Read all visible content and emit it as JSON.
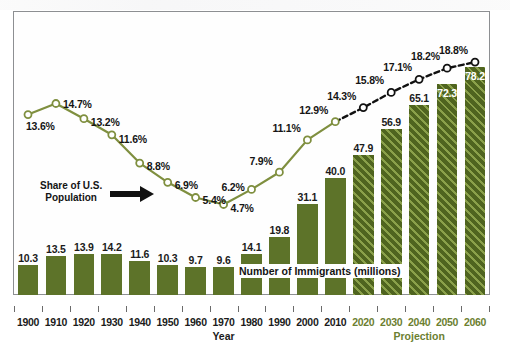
{
  "chart_data": {
    "type": "bar",
    "title": "",
    "subtitle": "",
    "xlabel": "Year",
    "ylabel": "",
    "grid": false,
    "legend_position": "none",
    "categories": [
      "1900",
      "1910",
      "1920",
      "1930",
      "1940",
      "1950",
      "1960",
      "1970",
      "1980",
      "1990",
      "2000",
      "2010",
      "2020",
      "2030",
      "2040",
      "2050",
      "2060"
    ],
    "series": [
      {
        "name": "Number of Immigrants (millions)",
        "type": "bar",
        "values": [
          10.3,
          13.5,
          13.9,
          14.2,
          11.6,
          10.3,
          9.7,
          9.6,
          14.1,
          19.8,
          31.1,
          40.0,
          47.9,
          56.9,
          65.1,
          72.3,
          78.2
        ],
        "labels": [
          "10.3",
          "13.5",
          "13.9",
          "14.2",
          "11.6",
          "10.3",
          "9.7",
          "9.6",
          "14.1",
          "19.8",
          "31.1",
          "40.0",
          "47.9",
          "56.9",
          "65.1",
          "72.3",
          "78.2"
        ],
        "projected_from_index": 12,
        "color": "#5d7329",
        "projection_color": "#4f641f"
      },
      {
        "name": "Share of U.S. Population",
        "type": "line",
        "values": [
          13.6,
          14.7,
          13.2,
          11.6,
          8.8,
          6.9,
          5.4,
          4.7,
          6.2,
          7.9,
          11.1,
          12.9,
          14.3,
          15.8,
          17.1,
          18.2,
          18.8
        ],
        "labels": [
          "13.6%",
          "14.7%",
          "13.2%",
          "11.6%",
          "8.8%",
          "6.9%",
          "5.4%",
          "4.7%",
          "6.2%",
          "7.9%",
          "11.1%",
          "12.9%",
          "14.3%",
          "15.8%",
          "17.1%",
          "18.2%",
          "18.8%"
        ],
        "projected_from_index": 12,
        "color": "#7f8f3f",
        "projection_color": "#111111",
        "marker": "open-circle"
      }
    ],
    "annotations": [
      {
        "name": "share-annotation",
        "text_line1": "Share of U.S.",
        "text_line2": "Population"
      },
      {
        "name": "immigrants-annotation",
        "text": "Number of Immigrants (millions)"
      }
    ],
    "axis_groups": [
      {
        "name": "year-group",
        "label": "Year"
      },
      {
        "name": "projection-group",
        "label": "Projection"
      }
    ],
    "ylim_bars": [
      0,
      85
    ],
    "ylim_line": [
      0,
      20
    ]
  },
  "colors": {
    "bar_green": "#5d7329",
    "hatch_green": "#8aa04a",
    "line_green": "#7f8f3f",
    "projection_black": "#111111",
    "projection_text": "#6c8031",
    "frame_border": "#8d8f92",
    "text_dark": "#151515"
  }
}
